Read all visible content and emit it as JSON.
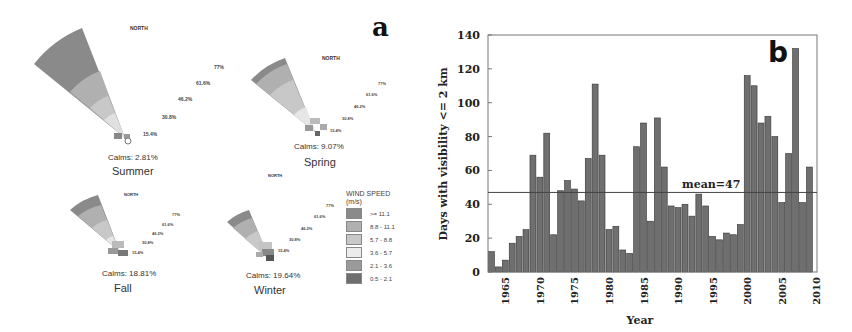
{
  "panel_a": {
    "label": "a",
    "north_label": "NORTH",
    "roses": [
      {
        "season": "Summer",
        "calms": "Calms: 2.81%",
        "rings": [
          "15.4%",
          "30.8%",
          "46.2%",
          "61.6%",
          "77%"
        ]
      },
      {
        "season": "Spring",
        "calms": "Calms: 9.07%",
        "rings": [
          "15.4%",
          "30.8%",
          "46.2%",
          "61.6%",
          "77%"
        ]
      },
      {
        "season": "Fall",
        "calms": "Calms: 18.81%",
        "rings": [
          "15.4%",
          "30.8%",
          "46.2%",
          "61.6%",
          "77%"
        ]
      },
      {
        "season": "Winter",
        "calms": "Calms: 19.64%",
        "rings": [
          "15.4%",
          "30.8%",
          "46.2%",
          "61.6%",
          "77%"
        ]
      }
    ],
    "legend": {
      "title": "WIND SPEED",
      "unit": "(m/s)",
      "items": [
        {
          "label": ">= 11.1",
          "color": "#8a8a8a"
        },
        {
          "label": "8.8 - 11.1",
          "color": "#b0b0b0"
        },
        {
          "label": "5.7 - 8.8",
          "color": "#c8c8c8"
        },
        {
          "label": "3.6 - 5.7",
          "color": "#ececec"
        },
        {
          "label": "2.1 - 3.6",
          "color": "#9a9a9a"
        },
        {
          "label": "0.5 - 2.1",
          "color": "#6e6e6e"
        }
      ]
    }
  },
  "chart_data": {
    "type": "bar",
    "panel_label": "b",
    "title": "",
    "xlabel": "Year",
    "ylabel": "Days with visibility <= 2 km",
    "ylim": [
      0,
      140
    ],
    "yticks": [
      0,
      20,
      40,
      60,
      80,
      100,
      120,
      140
    ],
    "xticks": [
      1965,
      1970,
      1975,
      1980,
      1985,
      1990,
      1995,
      2000,
      2005,
      2010
    ],
    "xlim": [
      1962.5,
      2010.1
    ],
    "categories": [
      1963,
      1964,
      1965,
      1966,
      1967,
      1968,
      1969,
      1970,
      1971,
      1972,
      1973,
      1974,
      1975,
      1976,
      1977,
      1978,
      1979,
      1980,
      1981,
      1982,
      1983,
      1984,
      1985,
      1986,
      1987,
      1988,
      1989,
      1990,
      1991,
      1992,
      1993,
      1994,
      1995,
      1996,
      1997,
      1998,
      1999,
      2000,
      2001,
      2002,
      2003,
      2004,
      2005,
      2006,
      2007,
      2008,
      2009
    ],
    "values": [
      12,
      3,
      7,
      17,
      21,
      25,
      69,
      56,
      82,
      22,
      48,
      54,
      49,
      42,
      67,
      111,
      69,
      25,
      27,
      13,
      11,
      74,
      88,
      30,
      91,
      62,
      39,
      38,
      40,
      33,
      46,
      39,
      21,
      19,
      23,
      22,
      28,
      116,
      110,
      88,
      92,
      80,
      41,
      70,
      132,
      41,
      62
    ],
    "mean_line": {
      "value": 47,
      "label": "mean=47"
    },
    "bar_color": "#6f6f6f",
    "grid": false
  }
}
